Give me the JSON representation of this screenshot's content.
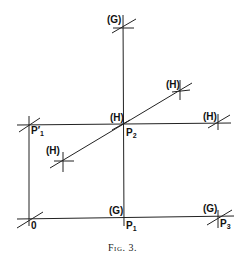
{
  "caption": "Fig. 3.",
  "labels": {
    "g_top": "(G)",
    "h_diag_upper": "(H)",
    "h_center": "(H)",
    "h_right": "(H)",
    "h_diag_lower": "(H)",
    "g_bottom_center": "(G)",
    "g_bottom_right": "(G)",
    "p1_prime": "P",
    "p1_prime_sub": "1",
    "p1_prime_mark": "′",
    "p2": "P",
    "p2_sub": "2",
    "origin": "0",
    "p1": "P",
    "p1_sub": "1",
    "p3": "P",
    "p3_sub": "3"
  }
}
